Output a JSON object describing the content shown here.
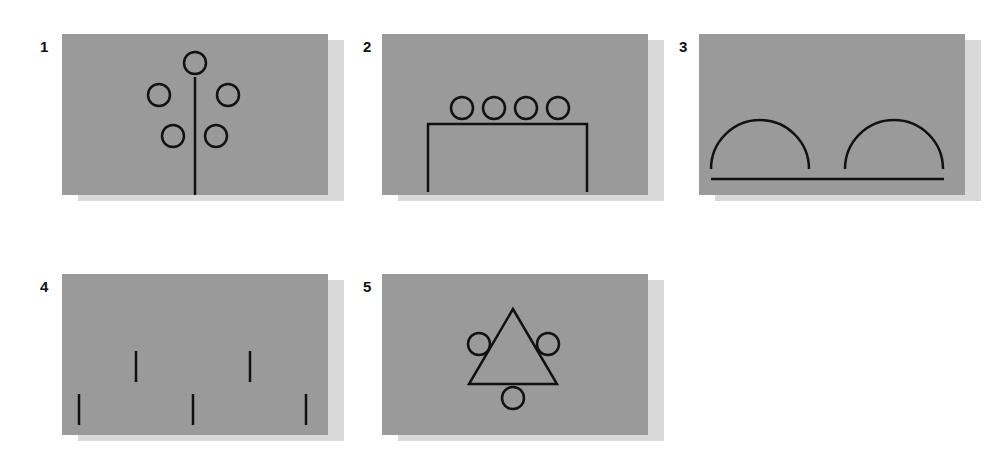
{
  "figure": {
    "panels": [
      {
        "number": "1",
        "description": "Vertical line with five circles arranged around it (one on top, two on each side)"
      },
      {
        "number": "2",
        "description": "Four circles resting on top of an open rectangle (table/arch shape)"
      },
      {
        "number": "3",
        "description": "Two semicircles sitting above a horizontal line"
      },
      {
        "number": "4",
        "description": "Five short vertical dashes in two staggered rows"
      },
      {
        "number": "5",
        "description": "Triangle with circles at left, right and bottom"
      }
    ],
    "colors": {
      "panel_bg": "#9a9a9a",
      "shadow": "#d9d9d9",
      "stroke": "#111111"
    }
  }
}
